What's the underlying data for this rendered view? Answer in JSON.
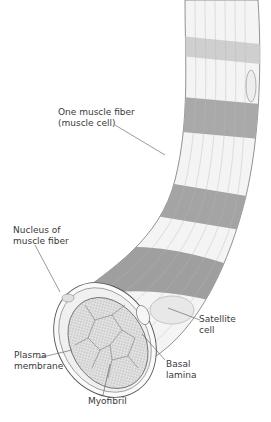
{
  "figure": {
    "labels": {
      "muscle_fiber": [
        "One muscle fiber",
        "(muscle cell)"
      ],
      "nucleus": [
        "Nucleus of",
        "muscle fiber"
      ],
      "satellite": [
        "Satellite",
        "cell"
      ],
      "plasma": [
        "Plasma",
        "membrane"
      ],
      "basal": [
        "Basal",
        "lamina"
      ],
      "myofibril": [
        "Myofibril"
      ]
    }
  }
}
